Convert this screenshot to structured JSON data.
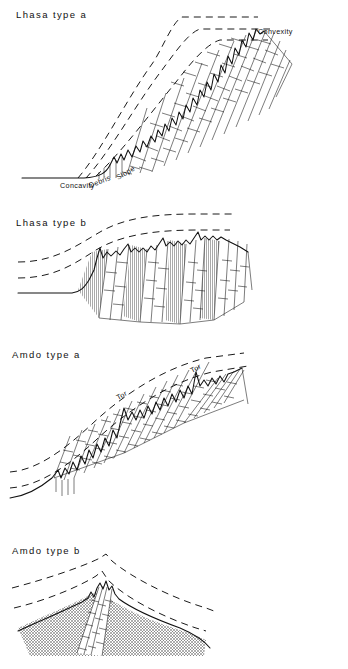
{
  "figure": {
    "kind": "slope-profile-diagram",
    "background_color": "#ffffff",
    "ink_color": "#111111",
    "panel_count": 4
  },
  "panels": [
    {
      "id": "lhasa-type-a",
      "title": "Lhasa  type a",
      "labels": [
        {
          "id": "concavity",
          "text": "Concavity",
          "rotation": 0,
          "x": 60,
          "y": 186
        },
        {
          "id": "debris",
          "text": "Debris",
          "rotation": -22,
          "x": 96,
          "y": 185
        },
        {
          "id": "slope",
          "text": "Slope",
          "rotation": -30,
          "x": 122,
          "y": 178
        },
        {
          "id": "convexity",
          "text": "Convexity",
          "rotation": 0,
          "x": 258,
          "y": 32
        }
      ],
      "dashed_line_count": 3,
      "fill_pattern": "brick-hatch"
    },
    {
      "id": "lhasa-type-b",
      "title": "Lhasa  type b",
      "labels": [],
      "dashed_line_count": 2,
      "fill_pattern": "brick-and-vertical-bands"
    },
    {
      "id": "amdo-type-a",
      "title": "Amdo  type a",
      "labels": [
        {
          "id": "tor-left",
          "text": "Tor",
          "rotation": -28,
          "x": 122,
          "y": 398
        },
        {
          "id": "tor-right",
          "text": "Tor",
          "rotation": -28,
          "x": 196,
          "y": 371
        }
      ],
      "dashed_line_count": 2,
      "fill_pattern": "brick-hatch"
    },
    {
      "id": "amdo-type-b",
      "title": "Amdo  type b",
      "labels": [],
      "dashed_line_count": 2,
      "fill_pattern": "stipple-with-brick-core"
    }
  ]
}
